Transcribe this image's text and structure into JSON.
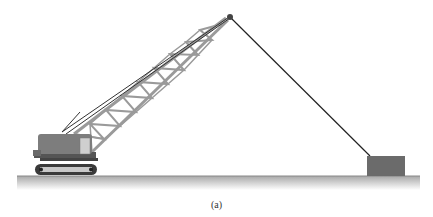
{
  "figure": {
    "caption": "(a)",
    "elements": {
      "crane": "crawler-crane",
      "boom": "lattice-boom",
      "boom_tip": "pulley-sheave",
      "cable": "hoist-cable",
      "load": "load-block",
      "ground": "ground-surface"
    }
  },
  "colors": {
    "boom": "#9a9a9a",
    "body": "#7a7a7a",
    "tracks": "#555555",
    "cable": "#222222",
    "load": "#6b6b6b",
    "ground_top": "#9a9a9a",
    "ground_fade": "#e6e6e6"
  }
}
